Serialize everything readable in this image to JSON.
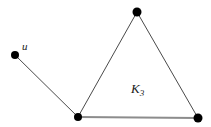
{
  "figure": {
    "background_color": "#ffffff",
    "width": 211,
    "height": 127,
    "labels": {
      "vertex_u": "u",
      "triangle_k": "K",
      "triangle_subscript": "3"
    },
    "colors": {
      "vertex_fill": "#000000",
      "thin_edge": "#4a4a4a",
      "thick_edge": "#8c8c8c",
      "label_text": "#1a1a1a"
    },
    "vertices": [
      {
        "id": "u",
        "name": "vertex-u",
        "cx": 15,
        "cy": 55,
        "r": 4
      },
      {
        "id": "v_bottom_left",
        "name": "vertex-bottom-left",
        "cx": 78,
        "cy": 117,
        "r": 4
      },
      {
        "id": "v_top",
        "name": "vertex-top",
        "cx": 137,
        "cy": 12,
        "r": 4.5
      },
      {
        "id": "v_bottom_right",
        "name": "vertex-bottom-right",
        "cx": 198,
        "cy": 118,
        "r": 4.5
      }
    ],
    "edges": [
      {
        "id": "e_u_bl",
        "name": "edge-u-bottom-left",
        "x1": 15,
        "y1": 55,
        "x2": 78,
        "y2": 117,
        "width": 1,
        "color": "#4a4a4a"
      },
      {
        "id": "e_bl_top",
        "name": "edge-bottom-left-top",
        "x1": 78,
        "y1": 117,
        "x2": 137,
        "y2": 12,
        "width": 1,
        "color": "#4a4a4a"
      },
      {
        "id": "e_top_br",
        "name": "edge-top-bottom-right",
        "x1": 137,
        "y1": 12,
        "x2": 198,
        "y2": 118,
        "width": 1,
        "color": "#4a4a4a"
      },
      {
        "id": "e_bl_br",
        "name": "edge-bottom-left-bottom-right",
        "x1": 78,
        "y1": 117,
        "x2": 198,
        "y2": 118,
        "width": 2.2,
        "color": "#8c8c8c"
      }
    ]
  }
}
